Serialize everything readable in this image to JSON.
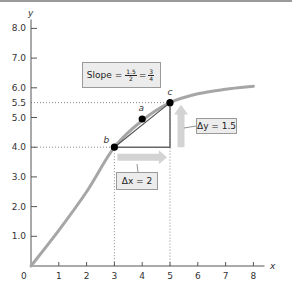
{
  "chart_data": {
    "type": "line",
    "title": "",
    "xlabel": "x",
    "ylabel": "y",
    "xlim": [
      0,
      8
    ],
    "ylim": [
      0,
      8
    ],
    "x_ticks": [
      "0",
      "1",
      "2",
      "3",
      "4",
      "5",
      "6",
      "7",
      "8"
    ],
    "y_ticks": [
      "1.0",
      "2.0",
      "3.0",
      "4.0",
      "5.0",
      "5.5",
      "6.0",
      "7.0",
      "8.0"
    ],
    "grid": false,
    "series": [
      {
        "name": "curve",
        "x": [
          0,
          1,
          2,
          3,
          4,
          5,
          6,
          7,
          8
        ],
        "y": [
          0,
          1.2,
          2.5,
          4.0,
          4.9,
          5.5,
          5.8,
          5.95,
          6.05
        ]
      },
      {
        "name": "secant",
        "x": [
          3,
          5
        ],
        "y": [
          4.0,
          5.5
        ]
      }
    ],
    "points": [
      {
        "label": "a",
        "x": 4,
        "y": 4.95
      },
      {
        "label": "b",
        "x": 3,
        "y": 4.0
      },
      {
        "label": "c",
        "x": 5,
        "y": 5.5
      }
    ],
    "annotations": {
      "slope": {
        "prefix": "Slope =",
        "frac1_num": "1.5",
        "frac1_den": "2",
        "eq": "=",
        "frac2_num": "3",
        "frac2_den": "4"
      },
      "delta_x": "Δx = 2",
      "delta_y": "Δy = 1.5"
    },
    "guides": {
      "dotted_y": [
        4.0,
        5.5
      ],
      "dotted_x": [
        3,
        5
      ]
    }
  },
  "axis": {
    "origin_label": "0",
    "x_label": "x",
    "y_label": "y"
  }
}
